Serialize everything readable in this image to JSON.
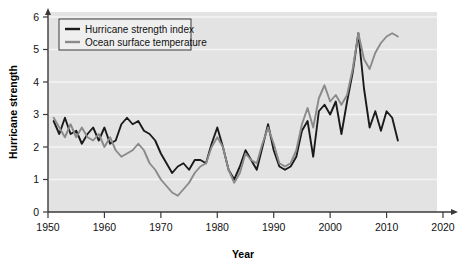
{
  "chart_data": {
    "type": "line",
    "title": "",
    "xlabel": "Year",
    "ylabel": "Hurricane strength",
    "xlim": [
      1950,
      2020
    ],
    "ylim": [
      0,
      6
    ],
    "xticks": [
      1950,
      1960,
      1970,
      1980,
      1990,
      2000,
      2010,
      2020
    ],
    "xtick_labels": [
      "1950",
      "1960",
      "1970",
      "1980",
      "1990",
      "2000",
      "2010",
      "2020"
    ],
    "yticks": [
      0,
      1,
      2,
      3,
      4,
      5,
      6
    ],
    "ytick_labels": [
      "0",
      "1",
      "2",
      "3",
      "4",
      "5",
      "6"
    ],
    "grid": true,
    "grid_axis": "y",
    "plot_background": "#e3e3e3",
    "legend_position": "top-left",
    "series": [
      {
        "name": "Hurricane strength index",
        "color": "#1a1a1a",
        "x": [
          1951,
          1952,
          1953,
          1954,
          1955,
          1956,
          1957,
          1958,
          1959,
          1960,
          1961,
          1962,
          1963,
          1964,
          1965,
          1966,
          1967,
          1968,
          1969,
          1970,
          1971,
          1972,
          1973,
          1974,
          1975,
          1976,
          1977,
          1978,
          1979,
          1980,
          1981,
          1982,
          1983,
          1984,
          1985,
          1986,
          1987,
          1988,
          1989,
          1990,
          1991,
          1992,
          1993,
          1994,
          1995,
          1996,
          1997,
          1998,
          1999,
          2000,
          2001,
          2002,
          2003,
          2004,
          2005,
          2006,
          2007,
          2008,
          2009,
          2010,
          2011,
          2012
        ],
        "values": [
          2.8,
          2.4,
          2.9,
          2.4,
          2.5,
          2.1,
          2.4,
          2.6,
          2.2,
          2.6,
          2.1,
          2.2,
          2.7,
          2.9,
          2.7,
          2.8,
          2.5,
          2.4,
          2.2,
          1.8,
          1.5,
          1.2,
          1.4,
          1.5,
          1.3,
          1.6,
          1.6,
          1.5,
          2.1,
          2.6,
          2.0,
          1.3,
          1.0,
          1.4,
          1.9,
          1.6,
          1.3,
          2.0,
          2.7,
          1.9,
          1.4,
          1.3,
          1.4,
          1.7,
          2.5,
          2.8,
          1.7,
          3.1,
          3.3,
          3.0,
          3.4,
          2.4,
          3.4,
          4.3,
          5.5,
          3.8,
          2.6,
          3.1,
          2.5,
          3.1,
          2.9,
          2.2
        ]
      },
      {
        "name": "Ocean surface temperature",
        "color": "#8a8a8a",
        "x": [
          1951,
          1952,
          1953,
          1954,
          1955,
          1956,
          1957,
          1958,
          1959,
          1960,
          1961,
          1962,
          1963,
          1964,
          1965,
          1966,
          1967,
          1968,
          1969,
          1970,
          1971,
          1972,
          1973,
          1974,
          1975,
          1976,
          1977,
          1978,
          1979,
          1980,
          1981,
          1982,
          1983,
          1984,
          1985,
          1986,
          1987,
          1988,
          1989,
          1990,
          1991,
          1992,
          1993,
          1994,
          1995,
          1996,
          1997,
          1998,
          1999,
          2000,
          2001,
          2002,
          2003,
          2004,
          2005,
          2006,
          2007,
          2008,
          2009,
          2010,
          2011,
          2012
        ],
        "values": [
          2.9,
          2.6,
          2.3,
          2.7,
          2.3,
          2.6,
          2.3,
          2.2,
          2.4,
          2.0,
          2.3,
          1.9,
          1.7,
          1.8,
          1.9,
          2.1,
          1.9,
          1.5,
          1.3,
          1.0,
          0.8,
          0.6,
          0.5,
          0.7,
          0.9,
          1.2,
          1.4,
          1.5,
          2.0,
          2.3,
          2.0,
          1.3,
          0.9,
          1.2,
          1.8,
          1.6,
          1.5,
          2.1,
          2.6,
          2.1,
          1.5,
          1.4,
          1.5,
          1.9,
          2.7,
          3.2,
          2.6,
          3.5,
          3.9,
          3.4,
          3.6,
          3.3,
          3.6,
          4.4,
          5.5,
          4.7,
          4.4,
          4.9,
          5.2,
          5.4,
          5.5,
          5.4
        ]
      }
    ]
  },
  "legend": {
    "entries": [
      {
        "label": "Hurricane strength index",
        "color": "#1a1a1a"
      },
      {
        "label": "Ocean surface temperature",
        "color": "#8a8a8a"
      }
    ]
  },
  "axes": {
    "x_title": "Year",
    "y_title": "Hurricane strength"
  }
}
